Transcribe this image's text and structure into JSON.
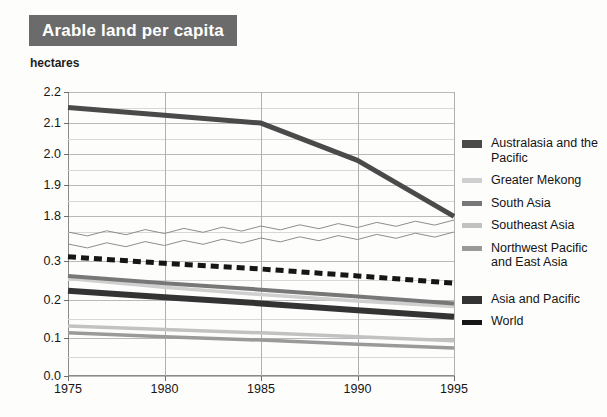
{
  "title": "Arable land per capita",
  "axis_unit_label": "hectares",
  "legend": {
    "entries": [
      {
        "label": "Australasia and the Pacific",
        "color": "#4a4a4a",
        "style": "solid",
        "weight": "thick"
      },
      {
        "label": "Greater Mekong",
        "color": "#cfcfcf",
        "style": "solid",
        "weight": "normal"
      },
      {
        "label": "South Asia",
        "color": "#777777",
        "style": "solid",
        "weight": "normal"
      },
      {
        "label": "Southeast Asia",
        "color": "#c2c2c2",
        "style": "solid",
        "weight": "normal"
      },
      {
        "label": "Northwest Pacific and East Asia",
        "color": "#9a9a9a",
        "style": "solid",
        "weight": "normal"
      },
      {
        "label": "Asia and Pacific",
        "color": "#333333",
        "style": "solid",
        "weight": "thick"
      },
      {
        "label": "World",
        "color": "#161616",
        "style": "dashed",
        "weight": "thick"
      }
    ]
  },
  "chart_data": {
    "type": "line",
    "title": "Arable land per capita",
    "xlabel": "",
    "ylabel": "hectares",
    "grid": true,
    "legend_position": "right",
    "x": [
      1975,
      1980,
      1985,
      1990,
      1995
    ],
    "xlim": [
      1975,
      1995
    ],
    "xticks": [
      "1975",
      "1980",
      "1985",
      "1990",
      "1995"
    ],
    "axis_break": true,
    "upper_panel": {
      "ylim": [
        1.75,
        2.2
      ],
      "yticks": [
        "2.2",
        "2.1",
        "2.0",
        "1.9",
        "1.8"
      ],
      "ytick_values": [
        2.2,
        2.1,
        2.0,
        1.9,
        1.8
      ],
      "minor_tick_step": 0.05
    },
    "lower_panel": {
      "ylim": [
        0.0,
        0.335
      ],
      "yticks": [
        "0.3",
        "0.2",
        "0.1",
        "0.0"
      ],
      "ytick_values": [
        0.3,
        0.2,
        0.1,
        0.0
      ],
      "minor_tick_step": 0.05
    },
    "series": [
      {
        "name": "Australasia and the Pacific",
        "panel": "upper",
        "color": "#4a4a4a",
        "style": "solid",
        "width": 5,
        "values": [
          2.15,
          2.125,
          2.1,
          1.98,
          1.8
        ]
      },
      {
        "name": "Greater Mekong",
        "panel": "lower",
        "color": "#cfcfcf",
        "style": "solid",
        "width": 3.5,
        "values": [
          0.255,
          0.232,
          0.213,
          0.196,
          0.182
        ]
      },
      {
        "name": "South Asia",
        "panel": "lower",
        "color": "#777777",
        "style": "solid",
        "width": 4,
        "values": [
          0.262,
          0.243,
          0.226,
          0.208,
          0.19
        ]
      },
      {
        "name": "Southeast Asia",
        "panel": "lower",
        "color": "#c2c2c2",
        "style": "solid",
        "width": 3.5,
        "values": [
          0.131,
          0.122,
          0.113,
          0.103,
          0.092
        ]
      },
      {
        "name": "Northwest Pacific and East Asia",
        "panel": "lower",
        "color": "#9a9a9a",
        "style": "solid",
        "width": 3.5,
        "values": [
          0.113,
          0.103,
          0.094,
          0.083,
          0.073
        ]
      },
      {
        "name": "Asia and Pacific",
        "panel": "lower",
        "color": "#333333",
        "style": "solid",
        "width": 6,
        "values": [
          0.223,
          0.206,
          0.19,
          0.172,
          0.155
        ]
      },
      {
        "name": "World",
        "panel": "lower",
        "color": "#161616",
        "style": "dashed",
        "width": 5,
        "values": [
          0.312,
          0.295,
          0.28,
          0.262,
          0.243
        ]
      }
    ]
  }
}
